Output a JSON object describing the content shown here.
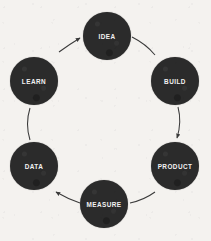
{
  "diagram": {
    "type": "cycle",
    "direction": "clockwise",
    "background_color": "#f4f2ef",
    "node_color": "#2b2b2b",
    "label_color": "#f2f2f2",
    "connector_color": "#3a3a3a",
    "nodes": [
      {
        "id": "idea",
        "label": "IDEA"
      },
      {
        "id": "build",
        "label": "BUILD"
      },
      {
        "id": "product",
        "label": "PRODUCT"
      },
      {
        "id": "measure",
        "label": "MEASURE"
      },
      {
        "id": "data",
        "label": "DATA"
      },
      {
        "id": "learn",
        "label": "LEARN"
      }
    ],
    "connectors": [
      {
        "from": "idea",
        "to": "build",
        "arrowhead": false
      },
      {
        "from": "build",
        "to": "product",
        "arrowhead": true
      },
      {
        "from": "product",
        "to": "measure",
        "arrowhead": false
      },
      {
        "from": "measure",
        "to": "data",
        "arrowhead": true
      },
      {
        "from": "data",
        "to": "learn",
        "arrowhead": false
      },
      {
        "from": "learn",
        "to": "idea",
        "arrowhead": true
      }
    ]
  }
}
